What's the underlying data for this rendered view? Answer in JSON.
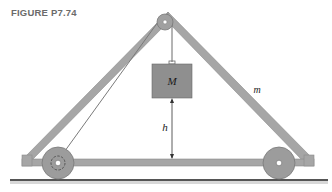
{
  "figure": {
    "label": "FIGURE P7.74"
  },
  "diagram": {
    "labels": {
      "mass_block": "M",
      "frame_mass": "m",
      "height": "h"
    },
    "colors": {
      "frame_fill": "#a6a6a6",
      "frame_stroke": "#8a8a8a",
      "block_fill": "#8f8f8f",
      "wheel_fill": "#9c9c9c",
      "ground": "#555555",
      "label_gray": "#6b6b6b"
    }
  }
}
